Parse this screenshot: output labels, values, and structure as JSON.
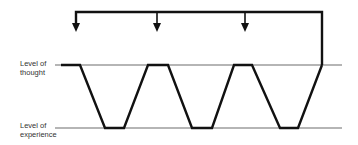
{
  "labels": {
    "thought": "Level of\nthought",
    "experience": "Level of\nexperience"
  },
  "colors": {
    "level_line": "#b5b5b5",
    "path": "#111111"
  },
  "geometry": {
    "thought_y": 65,
    "experience_y": 128,
    "level_line_x_start": 55,
    "level_line_x_end": 342,
    "zigzag_points": "61,65 80,65 105,128 124,128 148,65 168,65 192,128 212,128 234,65 252,65 280,128 298,128 322,65",
    "feedback_top_y": 12,
    "feedback_right_x": 322,
    "feedback_left_x": 76,
    "arrow_xs": [
      76,
      157,
      245
    ],
    "arrow_tip_y": 31
  }
}
